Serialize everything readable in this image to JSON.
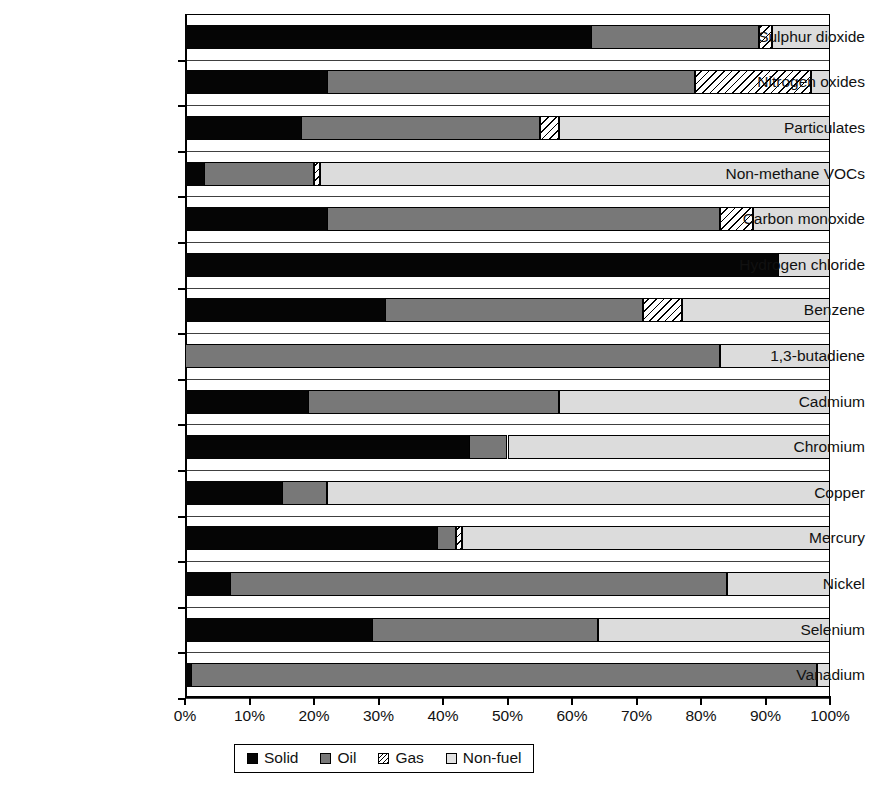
{
  "chart_data": {
    "type": "bar",
    "subtype": "stacked-horizontal-100-percent",
    "title": "",
    "xlabel": "",
    "ylabel": "",
    "xlim": [
      0,
      100
    ],
    "xtick_labels": [
      "0%",
      "10%",
      "20%",
      "30%",
      "40%",
      "50%",
      "60%",
      "70%",
      "80%",
      "90%",
      "100%"
    ],
    "xtick_values": [
      0,
      10,
      20,
      30,
      40,
      50,
      60,
      70,
      80,
      90,
      100
    ],
    "grid": false,
    "legend_position": "bottom-center",
    "categories": [
      "Sulphur dioxide",
      "Nitrogen oxides",
      "Particulates",
      "Non-methane VOCs",
      "Carbon monoxide",
      "Hydrogen chloride",
      "Benzene",
      "1,3-butadiene",
      "Cadmium",
      "Chromium",
      "Copper",
      "Mercury",
      "Nickel",
      "Selenium",
      "Vanadium"
    ],
    "series": [
      {
        "name": "Solid",
        "color": "#050505",
        "values": [
          63,
          22,
          18,
          3,
          22,
          92,
          31,
          0,
          19,
          44,
          15,
          39,
          7,
          29,
          1
        ]
      },
      {
        "name": "Oil",
        "color": "#787878",
        "values": [
          26,
          57,
          37,
          17,
          61,
          0,
          40,
          83,
          39,
          6,
          7,
          3,
          77,
          35,
          97
        ]
      },
      {
        "name": "Gas",
        "color": "#ffffff",
        "values": [
          2,
          18,
          3,
          1,
          5,
          0,
          6,
          0,
          0,
          0,
          0,
          1,
          0,
          0,
          0
        ]
      },
      {
        "name": "Non-fuel",
        "color": "#dcdcdc",
        "values": [
          9,
          3,
          42,
          79,
          12,
          8,
          23,
          17,
          42,
          50,
          78,
          57,
          16,
          36,
          2
        ]
      }
    ]
  },
  "legend": {
    "items": [
      {
        "label": "Solid",
        "swatch": "solid"
      },
      {
        "label": "Oil",
        "swatch": "oil"
      },
      {
        "label": "Gas",
        "swatch": "gas"
      },
      {
        "label": "Non-fuel",
        "swatch": "nonfuel"
      }
    ]
  }
}
